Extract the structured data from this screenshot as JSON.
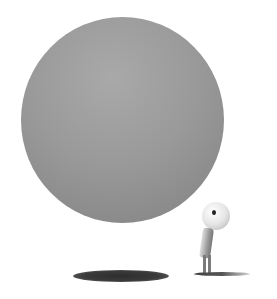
{
  "scene": {
    "description": "Large grey sphere floating above its shadow, with a small round-headed figure looking up at it",
    "colors": {
      "background": "#ffffff",
      "sphere": "#9a9a9a",
      "shadow": "#3a3a3a",
      "figure_head": "#e6e6e6"
    }
  },
  "caption": {
    "text": ""
  }
}
